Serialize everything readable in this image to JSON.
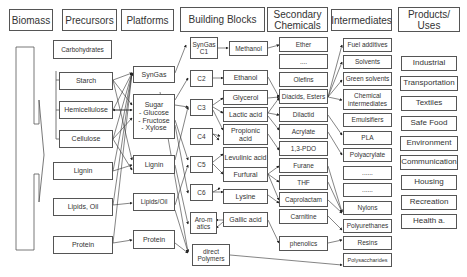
{
  "headers": {
    "biomass": "Biomass",
    "precursors": "Precursors",
    "platforms": "Platforms",
    "building_blocks": "Building Blocks",
    "secondary_chemicals": "Secondary Chemicals",
    "intermediates": "Intermediates",
    "products": "Products/ Uses"
  },
  "precursors": [
    "Carbohydrates",
    "Starch",
    "Hemicellulose",
    "Cellulose",
    "Lignin",
    "Lipids, Oil",
    "Protein"
  ],
  "platforms": {
    "syngas": "SynGas",
    "sugar_title": "Sugar",
    "sugar_items": [
      "- Glucose",
      "- Fructose",
      "- Xylose"
    ],
    "lignin": "Lignin",
    "lipids": "Lipids/Oil",
    "protein": "Protein"
  },
  "carbon_groups": [
    "SynGas C1",
    "C2",
    "C3",
    "C4",
    "C5",
    "C6",
    "Aro-matics",
    "direct Polymers"
  ],
  "building_blocks": [
    "Methanol",
    "Ethanol",
    "Glycerol",
    "Lactic acid",
    "Propionic acid",
    "Levulinic acid",
    "Furfural",
    "Lysine",
    "Gallic acid"
  ],
  "secondary_chemicals": [
    "Ether",
    "....",
    "Olefins",
    "Diacids, Esters",
    "Dilactid",
    "Acrylate",
    "1,3-PDO",
    "Furane",
    "THF",
    "Caprolactam",
    "Carnitine",
    "phenolics"
  ],
  "intermediates": [
    "Fuel additives",
    "Solvents",
    "Green solvents",
    "Chemical intermediates",
    "Emulsifiers",
    "PLA",
    "Polyacrylate",
    "......",
    "......",
    "Nylons",
    "Polyurethanes",
    "Resins",
    "Polysaccharides"
  ],
  "products": [
    "Industrial",
    "Transportation",
    "Textiles",
    "Safe Food",
    "Environment",
    "Communication",
    "Housing",
    "Recreation",
    "Health a."
  ]
}
